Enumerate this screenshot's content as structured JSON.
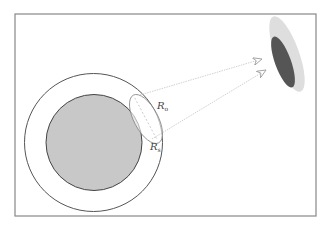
{
  "diagram": {
    "frame": {
      "x": 15,
      "y": 14,
      "width": 301,
      "height": 202,
      "stroke": "#888888"
    },
    "outer_circle": {
      "cx": 93.5,
      "cy": 142.5,
      "r": 69,
      "stroke": "#555555",
      "fill": "#ffffff"
    },
    "inner_circle": {
      "cx": 94,
      "cy": 142.5,
      "r": 48,
      "stroke": "#444444",
      "fill": "#c8c8c8"
    },
    "small_ellipse": {
      "cx": 146,
      "cy": 119,
      "rx": 12,
      "ry": 27,
      "rotate": -28,
      "stroke": "#888888"
    },
    "target_outer_ellipse": {
      "cx": 287,
      "cy": 54,
      "rx": 12,
      "ry": 40,
      "rotate": -20,
      "fill": "#dedede"
    },
    "target_inner_ellipse": {
      "cx": 283,
      "cy": 62,
      "rx": 8,
      "ry": 27,
      "rotate": -20,
      "fill": "#555555"
    },
    "rays": [
      {
        "x1": 140,
        "y1": 95,
        "x2": 262,
        "y2": 59
      },
      {
        "x1": 152,
        "y1": 139,
        "x2": 266,
        "y2": 70
      }
    ],
    "labels": {
      "r_o": {
        "main": "R",
        "sub": "o",
        "x": 157,
        "y": 109
      },
      "r_s": {
        "main": "R",
        "sub": "s",
        "x": 150,
        "y": 150
      }
    },
    "colors": {
      "ray": "#bbbbbb",
      "text": "#444444"
    }
  }
}
